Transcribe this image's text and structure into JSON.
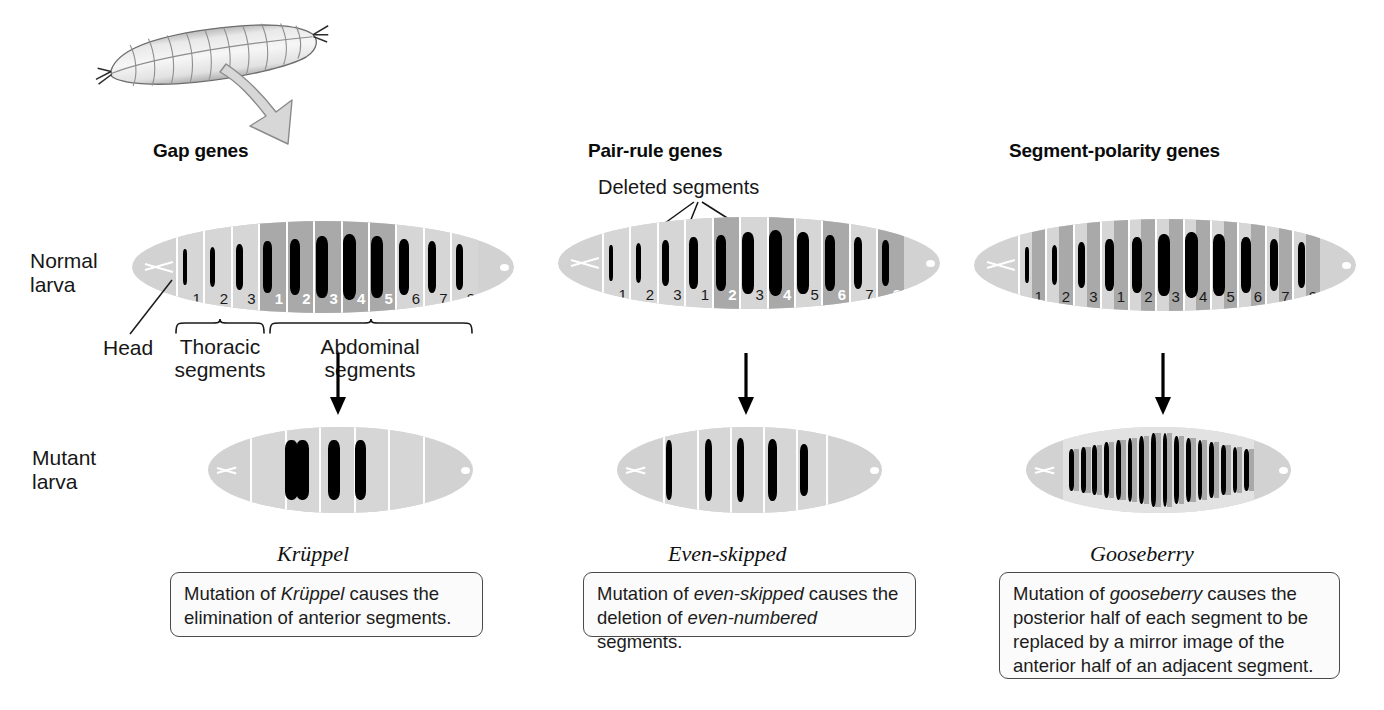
{
  "figure": {
    "top_specimen": "drosophila-larva-photo",
    "columns": [
      {
        "id": "gap",
        "header": "Gap genes",
        "gene_name": "Krüppel",
        "caption_parts": [
          "Mutation of ",
          "Krüppel",
          " causes the elimination of anterior segments."
        ],
        "caption_text": "Mutation of Krüppel causes the elimination of anterior segments."
      },
      {
        "id": "pair-rule",
        "header": "Pair-rule genes",
        "gene_name": "Even-skipped",
        "annotation": "Deleted segments",
        "caption_parts": [
          "Mutation of ",
          "even-skipped",
          " causes the deletion of ",
          "even-numbered",
          " segments."
        ],
        "caption_text": "Mutation of even-skipped causes the deletion of even-numbered segments."
      },
      {
        "id": "segment-polarity",
        "header": "Segment-polarity genes",
        "gene_name": "Gooseberry",
        "caption_parts": [
          "Mutation of ",
          "gooseberry",
          " causes the posterior half of each segment to be replaced by a mirror image of the anterior half of an adjacent segment."
        ],
        "caption_text": "Mutation of gooseberry causes the posterior half of each segment to be replaced by a mirror image of the anterior half of an adjacent segment."
      }
    ],
    "row_labels": {
      "normal": "Normal\nlarva",
      "normal_line1": "Normal",
      "normal_line2": "larva",
      "mutant_line1": "Mutant",
      "mutant_line2": "larva"
    },
    "anatomy_labels": {
      "head": "Head",
      "thoracic_line1": "Thoracic",
      "thoracic_line2": "segments",
      "abdominal_line1": "Abdominal",
      "abdominal_line2": "segments"
    },
    "segment_numbers": {
      "thoracic": [
        "1",
        "2",
        "3"
      ],
      "abdominal": [
        "1",
        "2",
        "3",
        "4",
        "5",
        "6",
        "7",
        "8"
      ]
    },
    "colors": {
      "body_light": "#d2d2d2",
      "segment_light": "#d6d6d6",
      "segment_dark": "#a9a9a9",
      "denticle": "#000000",
      "text": "#141414",
      "box_border": "#4a4a4a",
      "box_fill": "#fbfbfb"
    }
  },
  "chart_data": {
    "type": "diagram",
    "normal_larvae": [
      {
        "column": "gap",
        "segments": [
          {
            "label": "1",
            "group": "thoracic",
            "shade": "light",
            "num_color": "black"
          },
          {
            "label": "2",
            "group": "thoracic",
            "shade": "light",
            "num_color": "black"
          },
          {
            "label": "3",
            "group": "thoracic",
            "shade": "light",
            "num_color": "black"
          },
          {
            "label": "1",
            "group": "abdominal",
            "shade": "dark",
            "num_color": "white"
          },
          {
            "label": "2",
            "group": "abdominal",
            "shade": "dark",
            "num_color": "white"
          },
          {
            "label": "3",
            "group": "abdominal",
            "shade": "dark",
            "num_color": "white"
          },
          {
            "label": "4",
            "group": "abdominal",
            "shade": "dark",
            "num_color": "white"
          },
          {
            "label": "5",
            "group": "abdominal",
            "shade": "dark",
            "num_color": "white"
          },
          {
            "label": "6",
            "group": "abdominal",
            "shade": "light",
            "num_color": "black"
          },
          {
            "label": "7",
            "group": "abdominal",
            "shade": "light",
            "num_color": "black"
          },
          {
            "label": "8",
            "group": "abdominal",
            "shade": "light",
            "num_color": "black"
          }
        ]
      },
      {
        "column": "pair-rule",
        "segments": [
          {
            "label": "1",
            "group": "thoracic",
            "shade": "light",
            "num_color": "black"
          },
          {
            "label": "2",
            "group": "thoracic",
            "shade": "light",
            "num_color": "black"
          },
          {
            "label": "3",
            "group": "thoracic",
            "shade": "light",
            "num_color": "black"
          },
          {
            "label": "1",
            "group": "abdominal",
            "shade": "light",
            "num_color": "black"
          },
          {
            "label": "2",
            "group": "abdominal",
            "shade": "dark",
            "num_color": "white"
          },
          {
            "label": "3",
            "group": "abdominal",
            "shade": "light",
            "num_color": "black"
          },
          {
            "label": "4",
            "group": "abdominal",
            "shade": "dark",
            "num_color": "white"
          },
          {
            "label": "5",
            "group": "abdominal",
            "shade": "light",
            "num_color": "black"
          },
          {
            "label": "6",
            "group": "abdominal",
            "shade": "dark",
            "num_color": "white"
          },
          {
            "label": "7",
            "group": "abdominal",
            "shade": "light",
            "num_color": "black"
          },
          {
            "label": "8",
            "group": "abdominal",
            "shade": "dark",
            "num_color": "white"
          }
        ]
      },
      {
        "column": "segment-polarity",
        "segments": [
          {
            "label": "1",
            "group": "thoracic",
            "shade": "split",
            "num_color": "black"
          },
          {
            "label": "2",
            "group": "thoracic",
            "shade": "split",
            "num_color": "black"
          },
          {
            "label": "3",
            "group": "thoracic",
            "shade": "split",
            "num_color": "black"
          },
          {
            "label": "1",
            "group": "abdominal",
            "shade": "split",
            "num_color": "black"
          },
          {
            "label": "2",
            "group": "abdominal",
            "shade": "split",
            "num_color": "black"
          },
          {
            "label": "3",
            "group": "abdominal",
            "shade": "split",
            "num_color": "black"
          },
          {
            "label": "4",
            "group": "abdominal",
            "shade": "split",
            "num_color": "black"
          },
          {
            "label": "5",
            "group": "abdominal",
            "shade": "split",
            "num_color": "black"
          },
          {
            "label": "6",
            "group": "abdominal",
            "shade": "split",
            "num_color": "black"
          },
          {
            "label": "7",
            "group": "abdominal",
            "shade": "split",
            "num_color": "black"
          },
          {
            "label": "8",
            "group": "abdominal",
            "shade": "split",
            "num_color": "black"
          }
        ]
      }
    ],
    "mutant_larvae": [
      {
        "column": "gap",
        "gene": "Krüppel",
        "denticle_band_count": 4,
        "description": "anterior segments eliminated"
      },
      {
        "column": "pair-rule",
        "gene": "Even-skipped",
        "denticle_band_count": 5,
        "description": "even-numbered segments deleted"
      },
      {
        "column": "segment-polarity",
        "gene": "Gooseberry",
        "denticle_band_count": 16,
        "description": "posterior half of each segment replaced by mirror image of anterior half"
      }
    ]
  }
}
